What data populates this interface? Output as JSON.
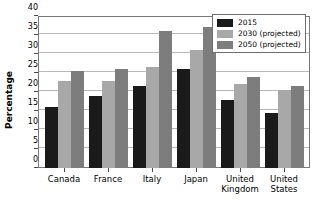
{
  "chart_data": {
    "type": "bar",
    "title": "",
    "xlabel": "",
    "ylabel": "Percentage",
    "ylim": [
      0,
      40
    ],
    "ytick_step": 5,
    "yticks": [
      0,
      5,
      10,
      15,
      20,
      25,
      30,
      35,
      40
    ],
    "ytick_labels": [
      "0",
      "5",
      "10",
      "15",
      "20",
      "25",
      "30",
      "35",
      "40"
    ],
    "grid": true,
    "grid_axis": "y",
    "legend_position": "top-right",
    "categories": [
      "Canada",
      "France",
      "Italy",
      "Japan",
      "United\nKingdom",
      "United\nStates"
    ],
    "series": [
      {
        "name": "2015",
        "color": "#1a1a1a",
        "values": [
          16.0,
          19.0,
          21.5,
          26.0,
          18.0,
          14.5
        ]
      },
      {
        "name": "2030 (projected)",
        "color": "#a8a8a8",
        "values": [
          23.0,
          23.0,
          26.5,
          31.0,
          22.0,
          20.5
        ]
      },
      {
        "name": "2050 (projected)",
        "color": "#7d7d7d",
        "values": [
          25.5,
          26.0,
          36.0,
          37.0,
          24.0,
          21.5
        ]
      }
    ]
  },
  "legend": {
    "entries": [
      {
        "label": "2015"
      },
      {
        "label": "2030 (projected)"
      },
      {
        "label": "2050 (projected)"
      }
    ]
  },
  "colors": {
    "series_2015": "#1a1a1a",
    "series_2030": "#a8a8a8",
    "series_2050": "#7d7d7d",
    "grid": "#b9b9b9",
    "axis": "#7a7a7a",
    "background": "#ffffff"
  }
}
